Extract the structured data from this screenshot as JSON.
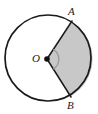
{
  "figure": {
    "type": "circle-sector-diagram",
    "background_color": "#ffffff",
    "stroke_color": "#1a1a1a",
    "sector_fill_color": "#c8c8c8",
    "angle_arc_color": "#9a9a9a",
    "center_dot_color": "#111111",
    "circle": {
      "center_x": 48,
      "center_y": 58,
      "radius": 43,
      "stroke_width": 1.6
    },
    "center_point": {
      "label": "O",
      "dot_radius": 2.6,
      "dot_x": 47,
      "dot_y": 59,
      "label_x": 32,
      "label_y": 53
    },
    "points": [
      {
        "label": "A",
        "x": 72,
        "y": 22,
        "angle_deg": 57,
        "label_x": 68,
        "label_y": 6
      },
      {
        "label": "B",
        "x": 71,
        "y": 96,
        "angle_deg": -56,
        "label_x": 67,
        "label_y": 100
      }
    ],
    "angle_marker": {
      "name": "central-angle-arc",
      "radius": 11,
      "start_angle_deg": -56,
      "end_angle_deg": 57,
      "sweep_deg": 113
    },
    "sector": {
      "name": "shaded-sector-AOB",
      "shaded": true,
      "sweep_deg": 113
    }
  }
}
